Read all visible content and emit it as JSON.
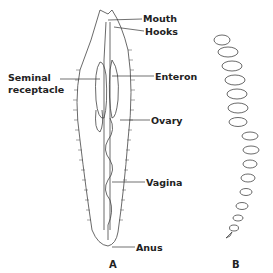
{
  "figure": {
    "panels": [
      {
        "id": "A",
        "label": "A",
        "subject": "flatworm-like organism, ventral view"
      },
      {
        "id": "B",
        "label": "B",
        "subject": "segmented coiled organism"
      }
    ],
    "labels": {
      "mouth": "Mouth",
      "hooks": "Hooks",
      "seminal_receptacle_line1": "Seminal",
      "seminal_receptacle_line2": "receptacle",
      "enteron": "Enteron",
      "ovary": "Ovary",
      "vagina": "Vagina",
      "anus": "Anus"
    },
    "colors": {
      "ink": "#333333",
      "background": "#ffffff"
    }
  }
}
